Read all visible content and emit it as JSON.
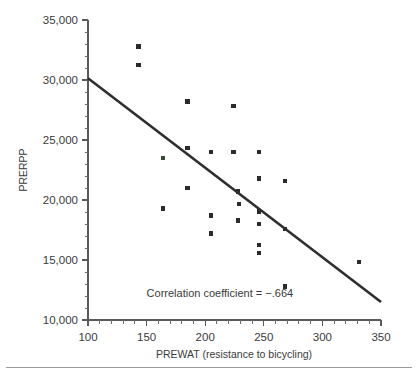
{
  "chart_data": {
    "type": "scatter",
    "title": "",
    "xlabel": "PREWAT (resistance to bicycling)",
    "ylabel": "PRERPP",
    "xlim": [
      100,
      350
    ],
    "ylim": [
      10000,
      35000
    ],
    "grid": false,
    "legend": null,
    "x_ticks": [
      100,
      150,
      200,
      250,
      300,
      350
    ],
    "x_tick_labels": [
      "100",
      "150",
      "200",
      "250",
      "300",
      "350"
    ],
    "x_minor_step": 10,
    "y_ticks": [
      10000,
      15000,
      20000,
      25000,
      30000,
      35000
    ],
    "y_tick_labels": [
      "10,000",
      "15,000",
      "20,000",
      "25,000",
      "30,000",
      "35,000"
    ],
    "y_minor_step": 1000,
    "annotation": "Correlation coefficient = −.664",
    "annotation_x": 150,
    "annotation_y": 11900,
    "correlation_coefficient": -0.664,
    "series": [
      {
        "name": "observations",
        "marker": "square",
        "color": "#2b2b2b",
        "points": [
          {
            "x": 143,
            "y": 32800
          },
          {
            "x": 143,
            "y": 31250
          },
          {
            "x": 185,
            "y": 28200
          },
          {
            "x": 224,
            "y": 27850
          },
          {
            "x": 185,
            "y": 24350
          },
          {
            "x": 205,
            "y": 24000
          },
          {
            "x": 224,
            "y": 24000
          },
          {
            "x": 246,
            "y": 24000
          },
          {
            "x": 164,
            "y": 23500,
            "tinted": true
          },
          {
            "x": 246,
            "y": 21800
          },
          {
            "x": 268,
            "y": 21600
          },
          {
            "x": 185,
            "y": 21000
          },
          {
            "x": 228,
            "y": 20700
          },
          {
            "x": 229,
            "y": 19650
          },
          {
            "x": 246,
            "y": 19050
          },
          {
            "x": 164,
            "y": 19300
          },
          {
            "x": 205,
            "y": 18700
          },
          {
            "x": 228,
            "y": 18300
          },
          {
            "x": 246,
            "y": 18000
          },
          {
            "x": 268,
            "y": 17600
          },
          {
            "x": 205,
            "y": 17200
          },
          {
            "x": 246,
            "y": 16250
          },
          {
            "x": 246,
            "y": 15600
          },
          {
            "x": 331,
            "y": 14850
          },
          {
            "x": 268,
            "y": 12800
          }
        ]
      }
    ],
    "fit_line": {
      "name": "regression-line",
      "color": "#2e2e2e",
      "x_start": 100,
      "y_start": 30150,
      "x_end": 350,
      "y_end": 11500
    }
  }
}
